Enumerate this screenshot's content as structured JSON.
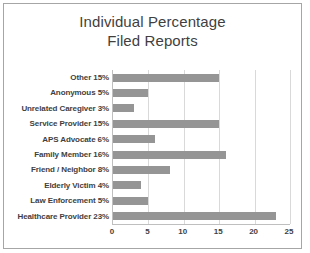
{
  "chart_data": {
    "type": "bar",
    "orientation": "horizontal",
    "title": "Individual Percentage\nFiled Reports",
    "title_lines": [
      "Individual Percentage",
      "Filed Reports"
    ],
    "xlabel": "",
    "ylabel": "",
    "xlim": [
      0,
      25
    ],
    "xticks": [
      0,
      5,
      10,
      15,
      20,
      25
    ],
    "xtick_labels": [
      "0",
      "5",
      "10",
      "15",
      "20",
      "25"
    ],
    "grid": true,
    "grid_axis": "x",
    "legend": false,
    "bar_color": "#959595",
    "gridline_color": "#d9d9d9",
    "axis_color": "#bfbfbf",
    "text_color": "#3f3f3f",
    "border_color": "#a6a6a6",
    "categories": [
      "Other 15%",
      "Anonymous 5%",
      "Unrelated Caregiver 3%",
      "Service Provider 15%",
      "APS Advocate 6%",
      "Family Member 16%",
      "Friend / Neighbor 8%",
      "Elderly Victim 4%",
      "Law Enforcement 5%",
      "Healthcare Provider 23%"
    ],
    "values": [
      15,
      5,
      3,
      15,
      6,
      16,
      8,
      4,
      5,
      23
    ]
  }
}
